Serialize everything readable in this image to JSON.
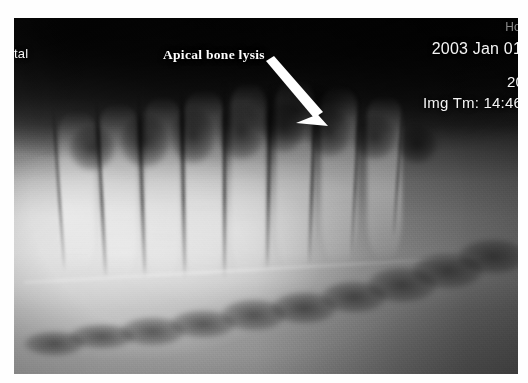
{
  "image": {
    "kind": "dental-periapical-radiograph",
    "description": "Grayscale dental radiograph showing tooth roots and alveolar bone",
    "background_color": "#ffffff",
    "plate_dark": "#161616",
    "plate_bright": "#c2c2c2"
  },
  "annotation": {
    "label": "Apical bone lysis",
    "color": "#fdfdfd",
    "arrow": {
      "name": "annotation-arrow",
      "color": "#ffffff",
      "from_x": 255,
      "from_y": 48,
      "to_x": 300,
      "to_y": 105
    }
  },
  "overlay": {
    "hospital_left_partial": "tal",
    "hospital_right_partial": "Ho",
    "date": "2003 Jan 01",
    "year_partial": "20",
    "img_time": "Img Tm: 14:46",
    "text_color": "#f4f4f4"
  },
  "chart_data": {
    "type": "heatmap",
    "title": "Apical bone lysis",
    "roots": [
      {
        "x_pct": 9,
        "top_pct": 26,
        "width_pct": 7.0,
        "height_pct": 46
      },
      {
        "x_pct": 17,
        "top_pct": 24,
        "width_pct": 7.5,
        "height_pct": 50
      },
      {
        "x_pct": 26,
        "top_pct": 22,
        "width_pct": 7.0,
        "height_pct": 52
      },
      {
        "x_pct": 34,
        "top_pct": 20,
        "width_pct": 7.5,
        "height_pct": 54
      },
      {
        "x_pct": 43,
        "top_pct": 18,
        "width_pct": 7.0,
        "height_pct": 55
      },
      {
        "x_pct": 52,
        "top_pct": 17,
        "width_pct": 7.5,
        "height_pct": 54
      },
      {
        "x_pct": 61,
        "top_pct": 19,
        "width_pct": 7.0,
        "height_pct": 50
      },
      {
        "x_pct": 70,
        "top_pct": 22,
        "width_pct": 7.0,
        "height_pct": 46
      }
    ],
    "pdl_lines": [
      {
        "x_pct": 7.5,
        "top_pct": 25,
        "height_pct": 46,
        "w": 2.4,
        "rot": -4
      },
      {
        "x_pct": 16.0,
        "top_pct": 23,
        "height_pct": 50,
        "w": 2.6,
        "rot": -3
      },
      {
        "x_pct": 24.5,
        "top_pct": 21,
        "height_pct": 52,
        "w": 2.6,
        "rot": -2
      },
      {
        "x_pct": 33.0,
        "top_pct": 19,
        "height_pct": 54,
        "w": 2.8,
        "rot": -1
      },
      {
        "x_pct": 41.5,
        "top_pct": 18,
        "height_pct": 55,
        "w": 2.6,
        "rot": 0
      },
      {
        "x_pct": 50.5,
        "top_pct": 17,
        "height_pct": 54,
        "w": 2.8,
        "rot": 1
      },
      {
        "x_pct": 59.5,
        "top_pct": 19,
        "height_pct": 50,
        "w": 2.6,
        "rot": 2
      },
      {
        "x_pct": 68.5,
        "top_pct": 21,
        "height_pct": 46,
        "w": 2.4,
        "rot": 3
      },
      {
        "x_pct": 77.0,
        "top_pct": 24,
        "height_pct": 38,
        "w": 2.2,
        "rot": 4
      }
    ],
    "interdental_blobs": [
      {
        "x_pct": 11,
        "y_pct": 30,
        "w_pct": 9,
        "h_pct": 13
      },
      {
        "x_pct": 21,
        "y_pct": 27,
        "w_pct": 10,
        "h_pct": 15
      },
      {
        "x_pct": 31,
        "y_pct": 25,
        "w_pct": 9,
        "h_pct": 16
      },
      {
        "x_pct": 40,
        "y_pct": 24,
        "w_pct": 10,
        "h_pct": 16
      },
      {
        "x_pct": 49,
        "y_pct": 23,
        "w_pct": 9,
        "h_pct": 15
      },
      {
        "x_pct": 58,
        "y_pct": 25,
        "w_pct": 9,
        "h_pct": 14
      },
      {
        "x_pct": 67,
        "y_pct": 27,
        "w_pct": 9,
        "h_pct": 13
      },
      {
        "x_pct": 76,
        "y_pct": 30,
        "w_pct": 8,
        "h_pct": 11
      }
    ],
    "canal_segments": [
      {
        "x_pct": 2,
        "y_pct": 88,
        "w_pct": 12,
        "h_pct": 7
      },
      {
        "x_pct": 11,
        "y_pct": 86,
        "w_pct": 13,
        "h_pct": 7
      },
      {
        "x_pct": 21,
        "y_pct": 84,
        "w_pct": 13,
        "h_pct": 8
      },
      {
        "x_pct": 31,
        "y_pct": 82,
        "w_pct": 13,
        "h_pct": 8
      },
      {
        "x_pct": 41,
        "y_pct": 79,
        "w_pct": 13,
        "h_pct": 9
      },
      {
        "x_pct": 51,
        "y_pct": 77,
        "w_pct": 13,
        "h_pct": 9
      },
      {
        "x_pct": 61,
        "y_pct": 74,
        "w_pct": 13,
        "h_pct": 9
      },
      {
        "x_pct": 70,
        "y_pct": 70,
        "w_pct": 14,
        "h_pct": 10
      },
      {
        "x_pct": 79,
        "y_pct": 66,
        "w_pct": 14,
        "h_pct": 10
      },
      {
        "x_pct": 88,
        "y_pct": 62,
        "w_pct": 14,
        "h_pct": 10
      }
    ]
  }
}
